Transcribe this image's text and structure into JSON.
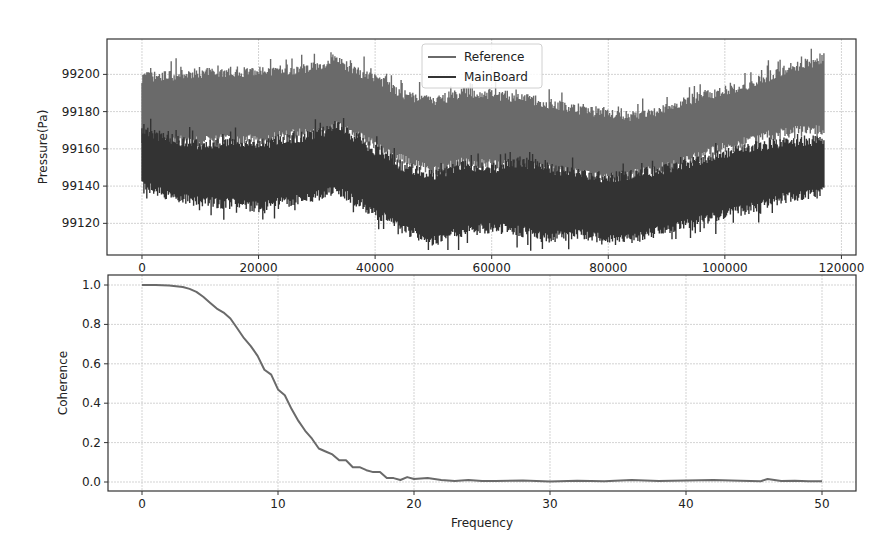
{
  "chart_data": [
    {
      "type": "line",
      "title": "",
      "xlabel": "",
      "ylabel": "Pressure(Pa)",
      "xlim": [
        -6000,
        122500
      ],
      "ylim": [
        99103,
        99219
      ],
      "xticks": [
        0,
        20000,
        40000,
        60000,
        80000,
        100000,
        120000
      ],
      "xtick_labels": [
        "0",
        "20000",
        "40000",
        "60000",
        "80000",
        "100000",
        "120000"
      ],
      "yticks": [
        99120,
        99140,
        99160,
        99180,
        99200
      ],
      "ytick_labels": [
        "99120",
        "99140",
        "99160",
        "99180",
        "99200"
      ],
      "grid": true,
      "legend_position": "upper center",
      "series": [
        {
          "name": "Reference",
          "color": "#6a6a6a",
          "x": [
            0,
            5000,
            10000,
            15000,
            20000,
            25000,
            30000,
            33000,
            36000,
            40000,
            45000,
            50000,
            55000,
            60000,
            65000,
            70000,
            75000,
            80000,
            85000,
            90000,
            95000,
            100000,
            105000,
            110000,
            115000,
            117000
          ],
          "upper": [
            99199,
            99200,
            99201,
            99202,
            99202,
            99203,
            99205,
            99209,
            99204,
            99198,
            99190,
            99186,
            99191,
            99190,
            99188,
            99185,
            99182,
            99180,
            99178,
            99183,
            99188,
            99192,
            99196,
            99203,
            99207,
            99210
          ],
          "lower": [
            99160,
            99164,
            99163,
            99165,
            99164,
            99167,
            99168,
            99172,
            99168,
            99162,
            99153,
            99147,
            99152,
            99151,
            99150,
            99148,
            99146,
            99143,
            99146,
            99150,
            99155,
            99160,
            99165,
            99168,
            99170,
            99170
          ]
        },
        {
          "name": "MainBoard",
          "color": "#333333",
          "x": [
            0,
            5000,
            10000,
            15000,
            20000,
            25000,
            30000,
            33000,
            36000,
            40000,
            45000,
            50000,
            55000,
            60000,
            65000,
            70000,
            75000,
            80000,
            85000,
            90000,
            95000,
            100000,
            105000,
            110000,
            115000,
            117000
          ],
          "upper": [
            99170,
            99166,
            99163,
            99164,
            99163,
            99166,
            99168,
            99173,
            99168,
            99160,
            99151,
            99146,
            99152,
            99150,
            99154,
            99150,
            99147,
            99145,
            99147,
            99150,
            99154,
            99158,
            99162,
            99164,
            99165,
            99166
          ],
          "lower": [
            99140,
            99134,
            99131,
            99130,
            99128,
            99131,
            99134,
            99138,
            99133,
            99125,
            99116,
            99110,
            99115,
            99117,
            99115,
            99112,
            99114,
            99110,
            99112,
            99116,
            99120,
            99124,
            99128,
            99133,
            99135,
            99136
          ]
        }
      ]
    },
    {
      "type": "line",
      "title": "",
      "xlabel": "Frequency",
      "ylabel": "Coherence",
      "xlim": [
        -2.5,
        52.5
      ],
      "ylim": [
        -0.045,
        1.05
      ],
      "xticks": [
        0,
        10,
        20,
        30,
        40,
        50
      ],
      "xtick_labels": [
        "0",
        "10",
        "20",
        "30",
        "40",
        "50"
      ],
      "yticks": [
        0.0,
        0.2,
        0.4,
        0.6,
        0.8,
        1.0
      ],
      "ytick_labels": [
        "0.0",
        "0.2",
        "0.4",
        "0.6",
        "0.8",
        "1.0"
      ],
      "grid": true,
      "series": [
        {
          "name": "Coherence",
          "color": "#6a6a6a",
          "x": [
            0,
            1,
            2,
            3,
            3.5,
            4,
            4.5,
            5,
            5.5,
            6,
            6.5,
            7,
            7.5,
            8,
            8.5,
            9,
            9.5,
            10,
            10.5,
            11,
            11.5,
            12,
            12.5,
            13,
            13.5,
            14,
            14.5,
            15,
            15.5,
            16,
            16.5,
            17,
            17.5,
            18,
            18.5,
            19,
            19.5,
            20,
            21,
            22,
            23,
            24,
            25,
            26,
            28,
            30,
            32,
            34,
            36,
            38,
            40,
            42,
            44,
            45.5,
            46,
            47,
            48,
            49,
            50
          ],
          "y": [
            1.0,
            1.0,
            0.998,
            0.99,
            0.98,
            0.965,
            0.94,
            0.91,
            0.88,
            0.86,
            0.83,
            0.78,
            0.73,
            0.69,
            0.64,
            0.57,
            0.545,
            0.47,
            0.44,
            0.37,
            0.31,
            0.26,
            0.22,
            0.17,
            0.155,
            0.14,
            0.11,
            0.11,
            0.075,
            0.075,
            0.06,
            0.05,
            0.05,
            0.02,
            0.02,
            0.01,
            0.025,
            0.015,
            0.02,
            0.01,
            0.005,
            0.01,
            0.005,
            0.005,
            0.008,
            0.003,
            0.006,
            0.004,
            0.01,
            0.005,
            0.008,
            0.01,
            0.006,
            0.004,
            0.015,
            0.005,
            0.006,
            0.004,
            0.004
          ]
        }
      ]
    }
  ],
  "top_plot": {
    "ylabel": "Pressure(Pa)",
    "legend": {
      "reference": "Reference",
      "mainboard": "MainBoard"
    },
    "xticks": [
      "0",
      "20000",
      "40000",
      "60000",
      "80000",
      "100000",
      "120000"
    ],
    "yticks": [
      "99120",
      "99140",
      "99160",
      "99180",
      "99200"
    ]
  },
  "bottom_plot": {
    "xlabel": "Frequency",
    "ylabel": "Coherence",
    "xticks": [
      "0",
      "10",
      "20",
      "30",
      "40",
      "50"
    ],
    "yticks": [
      "0.0",
      "0.2",
      "0.4",
      "0.6",
      "0.8",
      "1.0"
    ]
  }
}
